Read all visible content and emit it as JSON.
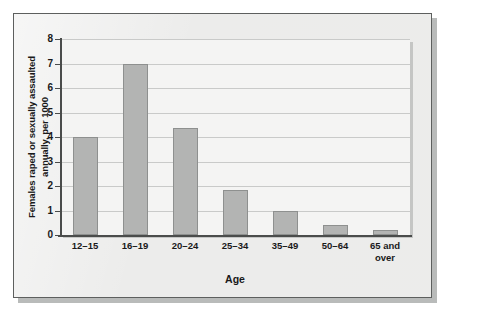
{
  "chart_data": {
    "type": "bar",
    "title": "",
    "xlabel": "Age",
    "ylabel": "Females raped or sexually assaulted annually, per 1000",
    "ylabel_line1": "Females raped or sexually assaulted",
    "ylabel_line2": "annually, per 1000",
    "categories": [
      "12–15",
      "16–19",
      "20–24",
      "25–34",
      "35–49",
      "50–64",
      "65 and over"
    ],
    "values": [
      4.0,
      7.0,
      4.35,
      1.85,
      1.0,
      0.4,
      0.2
    ],
    "ylim": [
      0,
      8
    ],
    "ytick_labels": [
      "0",
      "1",
      "2",
      "3",
      "4",
      "5",
      "6",
      "7",
      "8"
    ],
    "ytick_values": [
      0,
      1,
      2,
      3,
      4,
      5,
      6,
      7,
      8
    ],
    "grid": true,
    "legend": false,
    "bar_color": "#b3b4b3",
    "bar_border_color": "#8e908f",
    "axis_color": "#4a4c4b",
    "gridline_color": "#c9cac9",
    "plot_background": "#f4f4f3",
    "card_background": "#ececeb"
  }
}
